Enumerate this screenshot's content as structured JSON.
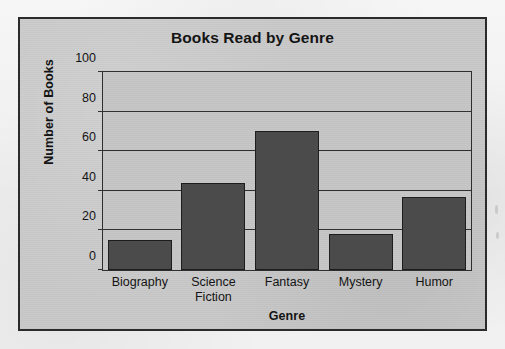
{
  "chart_data": {
    "type": "bar",
    "title": "Books Read by Genre",
    "xlabel": "Genre",
    "ylabel": "Number of Books",
    "categories": [
      "Biography",
      "Science Fiction",
      "Fantasy",
      "Mystery",
      "Humor"
    ],
    "category_lines": [
      [
        "Biography"
      ],
      [
        "Science",
        "Fiction"
      ],
      [
        "Fantasy"
      ],
      [
        "Mystery"
      ],
      [
        "Humor"
      ]
    ],
    "values": [
      15,
      44,
      70,
      18,
      37
    ],
    "ylim": [
      0,
      100
    ],
    "yticks": [
      0,
      20,
      40,
      60,
      80,
      100
    ],
    "ytick_labels": [
      "0",
      "20",
      "40",
      "60",
      "80",
      "100"
    ],
    "grid": "horizontal",
    "legend": "none",
    "bar_color": "#4b4b4b",
    "plot_background": "#c6c6c6",
    "figure_background": "#c9c9c9",
    "axis_color": "#2e2e2e",
    "text_color": "#141414"
  }
}
